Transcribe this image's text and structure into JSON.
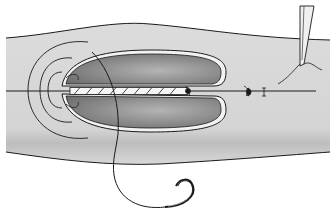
{
  "figure": {
    "type": "surgical-illustration",
    "colors": {
      "background": "#ffffff",
      "tissue": "#d6d6d6",
      "tissue_shadow": "#bdbdbd",
      "wound_dark": "#7a7a7a",
      "wound_light": "#a8a8a8",
      "rim": "#f2f2f2",
      "line": "#1a1a1a"
    },
    "elements": [
      "tissue-band",
      "oval-wound-upper-lobe",
      "oval-wound-lower-lobe",
      "twisted-suture-strand",
      "concentric-arcs-left",
      "suture-knots",
      "curved-needle",
      "forceps"
    ]
  }
}
